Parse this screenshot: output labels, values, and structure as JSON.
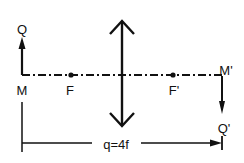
{
  "diagram": {
    "colors": {
      "ink": "#111111",
      "background": "#ffffff"
    },
    "labels": {
      "object_top": "Q",
      "object_base": "M",
      "focal_front": "F",
      "focal_back": "F'",
      "image_base": "M'",
      "image_top": "Q'",
      "distance": "q=4f"
    },
    "elements": {
      "optical_axis": "dash-dot line",
      "lens": "double-headed arrow (converging lens)",
      "object": "upward arrow",
      "image": "downward arrow (inverted real image)",
      "dimension": "distance marker from M to M'"
    }
  }
}
